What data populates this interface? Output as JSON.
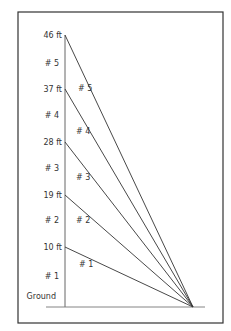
{
  "diagram": {
    "type": "guy-wire elevation diagram",
    "frame": {
      "x": 18,
      "y": 12,
      "width": 205,
      "height": 311,
      "stroke": "#333333"
    },
    "pole": {
      "x": 65,
      "top_y": 35,
      "bottom_y": 307,
      "stroke": "#555555"
    },
    "ground": {
      "label": "Ground",
      "y": 307,
      "x1": 46,
      "x2": 205,
      "stroke": "#777777"
    },
    "anchor": {
      "x": 193,
      "y": 307
    },
    "heights": [
      {
        "label": "46 ft",
        "y": 35
      },
      {
        "label": "37 ft",
        "y": 89
      },
      {
        "label": "28 ft",
        "y": 142
      },
      {
        "label": "19 ft",
        "y": 195
      },
      {
        "label": "10 ft",
        "y": 247
      }
    ],
    "segment_labels": [
      {
        "label": "# 5",
        "y": 63
      },
      {
        "label": "# 4",
        "y": 115
      },
      {
        "label": "# 3",
        "y": 168
      },
      {
        "label": "# 2",
        "y": 220
      },
      {
        "label": "# 1",
        "y": 276
      }
    ],
    "wires": [
      {
        "label": "# 5",
        "from_y": 35,
        "label_x": 78,
        "label_y": 91
      },
      {
        "label": "# 4",
        "from_y": 89,
        "label_x": 76,
        "label_y": 134
      },
      {
        "label": "# 3",
        "from_y": 142,
        "label_x": 76,
        "label_y": 180
      },
      {
        "label": "# 2",
        "from_y": 195,
        "label_x": 76,
        "label_y": 223
      },
      {
        "label": "# 1",
        "from_y": 247,
        "label_x": 79,
        "label_y": 267
      }
    ],
    "wire_stroke": "#333333"
  }
}
